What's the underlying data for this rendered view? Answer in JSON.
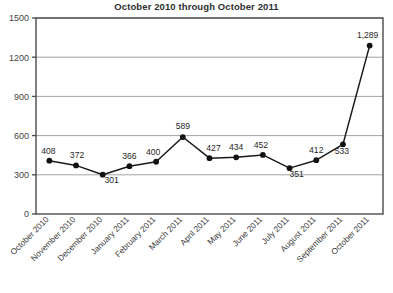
{
  "chart_data": {
    "type": "line",
    "title": "October 2010 through October 2011",
    "xlabel": "",
    "ylabel": "",
    "ylim": [
      0,
      1500
    ],
    "yticks": [
      0,
      300,
      600,
      900,
      1200,
      1500
    ],
    "ytick_labels": [
      "0",
      "300",
      "600",
      "900",
      "1200",
      "1500"
    ],
    "grid": true,
    "legend": false,
    "marker": "filled-circle",
    "line_color": "#1a1a1a",
    "categories": [
      "October 2010",
      "November 2010",
      "December 2010",
      "January 2011",
      "February 2011",
      "March 2011",
      "April 2011",
      "May 2011",
      "June 2011",
      "July 2011",
      "August 2011",
      "September 2011",
      "October 2011"
    ],
    "values": [
      408,
      372,
      301,
      366,
      400,
      589,
      427,
      434,
      452,
      351,
      412,
      533,
      1289
    ],
    "point_labels": [
      "408",
      "372",
      "301",
      "366",
      "400",
      "589",
      "427",
      "434",
      "452",
      "351",
      "412",
      "533",
      "1,289"
    ]
  }
}
